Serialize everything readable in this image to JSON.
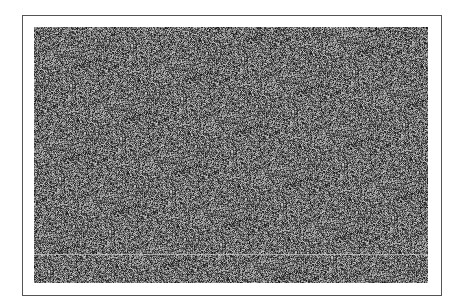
{
  "image": {
    "description": "static noise image inside a thin rectangular frame",
    "frame_color": "#555555",
    "background_color": "#ffffff",
    "noise": {
      "mean_gray": 110,
      "spread": 150,
      "width": 394,
      "height": 256
    },
    "scanline": {
      "y_offset": 227,
      "color": "#e6e6e6"
    }
  }
}
